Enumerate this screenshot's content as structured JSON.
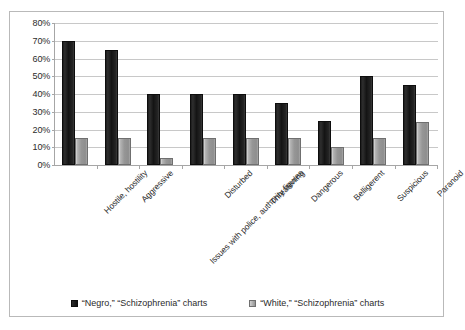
{
  "chart_data": {
    "type": "bar",
    "title": "",
    "xlabel": "",
    "ylabel": "",
    "ylim": [
      0,
      80
    ],
    "ytick_labels": [
      "80%",
      "70%",
      "60%",
      "50%",
      "40%",
      "30%",
      "20%",
      "10%",
      "0%"
    ],
    "ytick_values": [
      80,
      70,
      60,
      50,
      40,
      30,
      20,
      10,
      0
    ],
    "grid": true,
    "legend_position": "bottom",
    "categories": [
      "Hostile, hostility",
      "Aggressive",
      "Issues with police, authority figures",
      "Disturbed",
      "Threatening",
      "Dangerous",
      "Belligerent",
      "Suspicious",
      "Paranoid"
    ],
    "series": [
      {
        "name": "“Negro,” “Schizophrenia” charts",
        "color": "#1f1f1f",
        "values": [
          70,
          65,
          40,
          40,
          40,
          35,
          25,
          50,
          45
        ]
      },
      {
        "name": "“White,” “Schizophrenia” charts",
        "color": "#9a9a9a",
        "values": [
          15,
          15,
          4,
          15,
          15,
          15,
          10,
          15,
          24
        ]
      }
    ]
  },
  "colors": {
    "bar_dark": "#1f1f1f",
    "bar_light": "#9a9a9a",
    "gridline": "#c8c8c8",
    "axis": "#a6a6a6",
    "frame_border": "#b9b9b9",
    "text": "#2b2b2b",
    "background": "#ffffff"
  }
}
